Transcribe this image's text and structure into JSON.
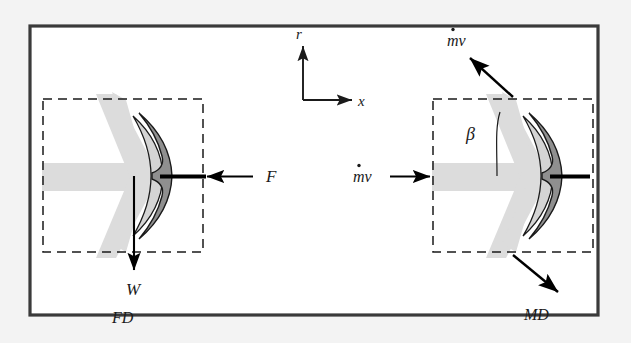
{
  "figure": {
    "background_color": "#f3f3f3",
    "plate_color": "#ffffff",
    "border_color": "#3a3a3a",
    "jet_color": "#dcdcdc",
    "vane_fill_color": "#8f8f8f",
    "vane_light_color": "#d4d4d4",
    "vane_outline_color": "#1a1a1a",
    "rod_color": "#000000",
    "dashed_box_color": "#1a1a1a",
    "arrow_color": "#000000"
  },
  "axes": {
    "vertical_label": "r",
    "horizontal_label": "x"
  },
  "diagrams": [
    {
      "id": "fd",
      "caption": "FD",
      "caption_full": "Free-body Diagram",
      "labels": {
        "force": "F",
        "weight": "W"
      }
    },
    {
      "id": "md",
      "caption": "MD",
      "caption_full": "Momentum Diagram",
      "labels": {
        "inlet_momentum": "mv",
        "inlet_momentum_dot": "·",
        "outlet_momentum_top": "mv",
        "outlet_momentum_bottom": "",
        "angle": "β"
      }
    }
  ],
  "annotations": {
    "r_axis": "r",
    "x_axis": "x",
    "force_F": "F",
    "weight_W": "W",
    "beta": "β",
    "mdot_v_in": "mv",
    "mdot_v_out": "mv",
    "fd_caption": "FD",
    "md_caption": "MD"
  }
}
